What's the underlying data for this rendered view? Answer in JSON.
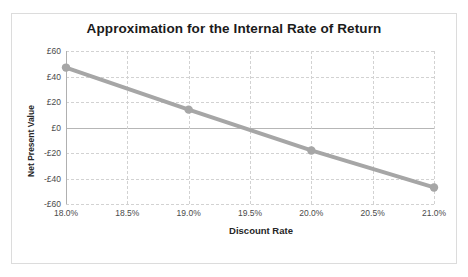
{
  "chart_data": {
    "type": "line",
    "title": "Approximation for the Internal Rate of Return",
    "xlabel": "Discount Rate",
    "ylabel": "Net Present Value",
    "x": [
      18.0,
      19.0,
      20.0,
      21.0
    ],
    "values": [
      47,
      14,
      -18,
      -47
    ],
    "series": [
      {
        "name": "Net Present Value",
        "values": [
          47,
          14,
          -18,
          -47
        ],
        "color": "#a6a6a6"
      }
    ],
    "xlim": [
      18.0,
      21.0
    ],
    "ylim": [
      -60,
      60
    ],
    "xticks": [
      18.0,
      18.5,
      19.0,
      19.5,
      20.0,
      20.5,
      21.0
    ],
    "xtick_labels": [
      "18.0%",
      "18.5%",
      "19.0%",
      "19.5%",
      "20.0%",
      "20.5%",
      "21.0%"
    ],
    "yticks": [
      60,
      40,
      20,
      0,
      -20,
      -40,
      -60
    ],
    "ytick_labels": [
      "£60",
      "£40",
      "£20",
      "£0",
      "-£20",
      "-£40",
      "-£60"
    ],
    "grid": true,
    "legend": false,
    "legend_position": "none",
    "marker": "circle",
    "colors": {
      "line": "#a6a6a6",
      "marker": "#a6a6a6",
      "grid": "#d2d2d2",
      "zero_line": "#b6b6b6",
      "axis": "#b0b0b0",
      "text": "#4a4a4a",
      "title": "#1b1b1b",
      "border": "#dcdcdc",
      "background": "#ffffff"
    }
  }
}
